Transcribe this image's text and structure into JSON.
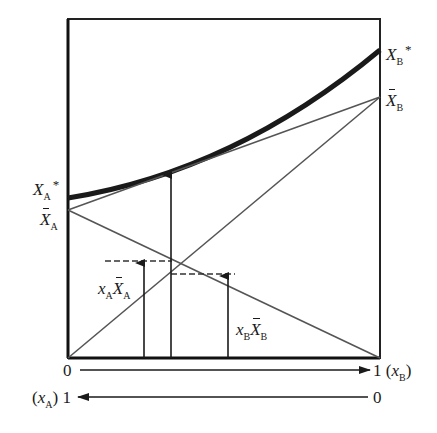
{
  "diagram": {
    "type": "mixture-property tangent construction",
    "labels": {
      "xa_star": {
        "base": "X",
        "sub": "A",
        "sup": "*"
      },
      "xa_bar": {
        "base": "X",
        "sub": "A",
        "bar": true
      },
      "xb_star": {
        "base": "X",
        "sub": "B",
        "sup": "*"
      },
      "xb_bar": {
        "base": "X",
        "sub": "B",
        "bar": true
      },
      "xa_xbar_a": {
        "coef": "x",
        "coef_sub": "A",
        "base": "X",
        "sub": "A"
      },
      "xb_xbar_b": {
        "coef": "x",
        "coef_sub": "B",
        "base": "X",
        "sub": "B"
      }
    },
    "axis_b": {
      "start": "0",
      "end": "1",
      "var": "x",
      "var_sub": "B"
    },
    "axis_a": {
      "start": "1",
      "end": "0",
      "var": "x",
      "var_sub": "A"
    },
    "caption_visible": "clipped / illegible",
    "colors": {
      "curve": "#1a1a1a",
      "lines": "#555555",
      "frame": "#222222"
    }
  }
}
